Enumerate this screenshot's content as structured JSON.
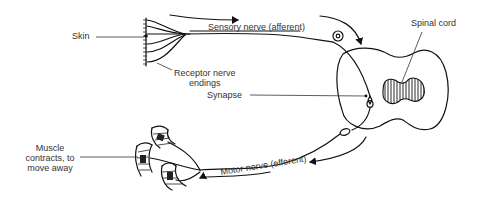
{
  "diagram": {
    "type": "reflex-arc",
    "labels": {
      "skin": "Skin",
      "receptor_line1": "Receptor nerve",
      "receptor_line2": "endings",
      "sensory_nerve": "Sensory nerve (afferent)",
      "spinal_cord": "Spinal cord",
      "synapse": "Synapse",
      "muscle_line1": "Muscle",
      "muscle_line2": "contracts, to",
      "muscle_line3": "move away",
      "motor_nerve": "Motor nerve (efferent)"
    },
    "colors": {
      "line": "#111111",
      "text": "#333333",
      "background": "#ffffff"
    }
  }
}
